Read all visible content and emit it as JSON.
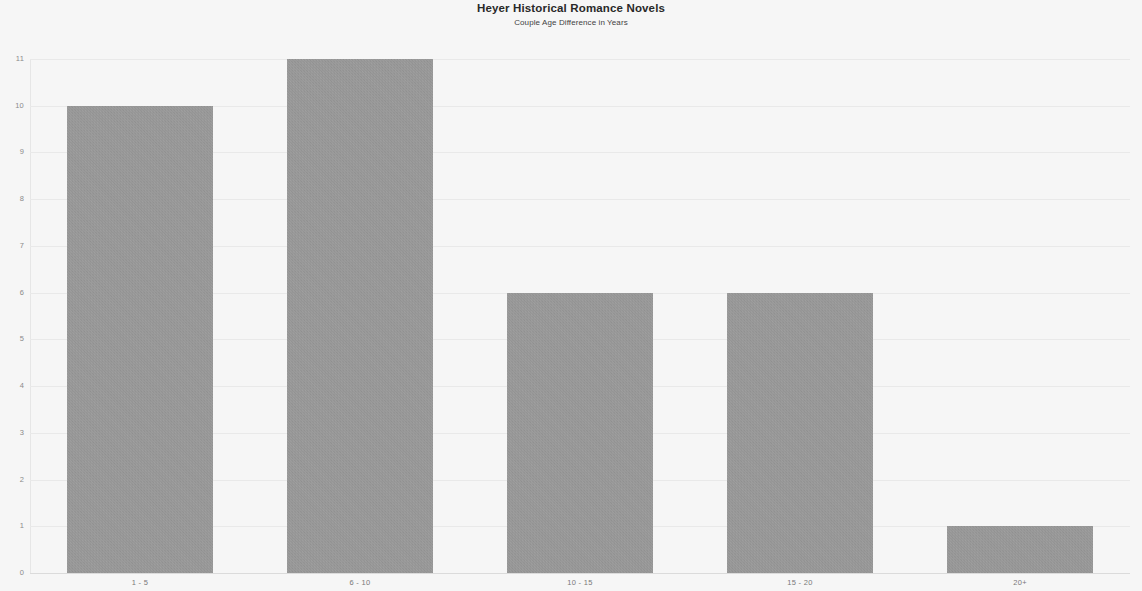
{
  "chart_data": {
    "type": "bar",
    "title": "Heyer Historical Romance Novels",
    "subtitle": "Couple Age Difference in Years",
    "xlabel": "",
    "ylabel": "",
    "categories": [
      "1 - 5",
      "6 - 10",
      "10 - 15",
      "15 - 20",
      "20+"
    ],
    "values": [
      10,
      11,
      6,
      6,
      1
    ],
    "ylim": [
      0,
      11
    ],
    "yticks": [
      0,
      1,
      2,
      3,
      4,
      5,
      6,
      7,
      8,
      9,
      10,
      11
    ],
    "ytick_labels": [
      "0",
      "1",
      "2",
      "3",
      "4",
      "5",
      "6",
      "7",
      "8",
      "9",
      "10",
      "11"
    ],
    "grid": true,
    "legend": null,
    "bar_color": "#a2a2a2",
    "background_color": "#ffffff",
    "series": [
      {
        "name": "Couple Age Difference in Years",
        "values": [
          10,
          11,
          6,
          6,
          1
        ]
      }
    ]
  }
}
